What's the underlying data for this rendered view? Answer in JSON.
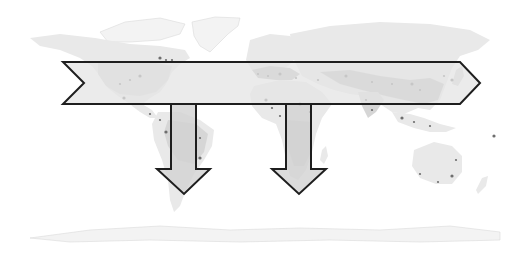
{
  "figure": {
    "background_color": "#ffffff",
    "land_colors": {
      "light": "#e9e9e9",
      "mid": "#d6d6d6",
      "dark": "#bdbdbd",
      "ice": "#f3f3f3",
      "population_dots": "#6e6e6e"
    },
    "arrows": [
      {
        "id": "east-west-band",
        "direction": "east",
        "span": "North America to East Asia",
        "fill": "#e4e4e4",
        "fill_opacity": 0.75,
        "stroke": "#1e1e1e"
      },
      {
        "id": "south-america-arrow",
        "direction": "south",
        "span": "into South America",
        "fill": "#d2d2d2",
        "fill_opacity": 0.8,
        "stroke": "#1e1e1e"
      },
      {
        "id": "africa-arrow",
        "direction": "south",
        "span": "into Southern Africa",
        "fill": "#d2d2d2",
        "fill_opacity": 0.8,
        "stroke": "#1e1e1e"
      }
    ],
    "regions": [
      "North America",
      "Greenland",
      "South America",
      "Europe",
      "Africa",
      "Asia",
      "Australia",
      "Antarctica"
    ]
  }
}
